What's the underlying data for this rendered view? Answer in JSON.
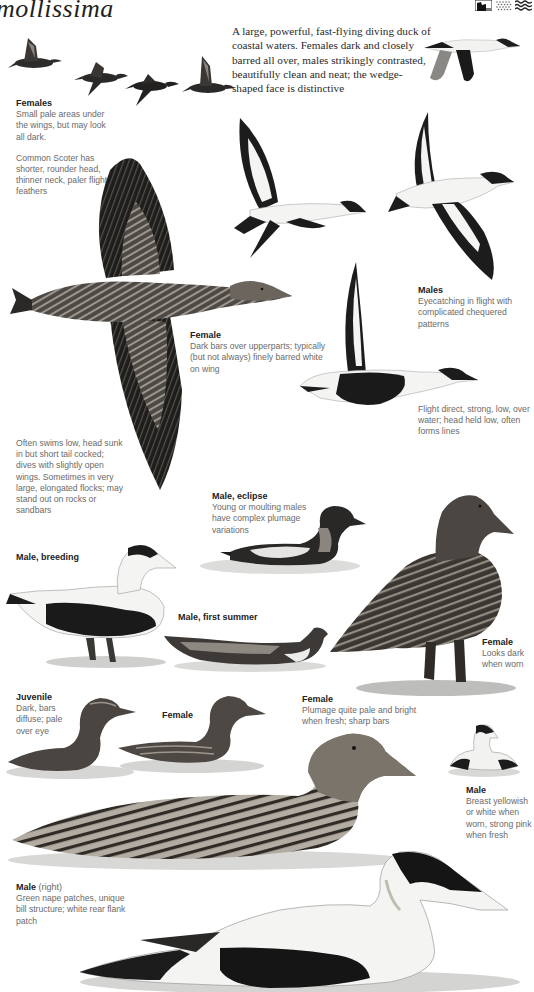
{
  "page": {
    "title_fragment": "mollissima",
    "habitat_icons": [
      {
        "name": "cliff-icon"
      },
      {
        "name": "shore-icon"
      },
      {
        "name": "sea-icon"
      }
    ],
    "intro": "A large, powerful, fast-flying diving duck of coastal waters. Females dark and closely barred all over, males strikingly contrasted, beautifully clean and neat; the wedge-shaped face is distinctive"
  },
  "captions": {
    "females_flock": {
      "heading": "Females",
      "text": "Small pale areas under the wings, but may look all dark.",
      "note": "Common Scoter has shorter, rounder head, thinner neck, paler flight feathers"
    },
    "female_flight": {
      "heading": "Female",
      "text": "Dark bars over upperparts; typically (but not always) finely barred white on wing"
    },
    "males_flight": {
      "heading": "Males",
      "text": "Eyecatching in flight with complicated chequered patterns"
    },
    "flight_behaviour": {
      "text": "Flight direct, strong, low, over water; head held low, often forms lines"
    },
    "swimming_behaviour": {
      "text": "Often swims low, head sunk in but short tail cocked; dives with slightly open wings. Sometimes in very large, elongated flocks; may stand out on rocks or sandbars"
    },
    "male_eclipse": {
      "heading": "Male, eclipse",
      "text": "Young or moulting males have complex plumage variations"
    },
    "male_breeding": {
      "heading": "Male, breeding"
    },
    "male_first_summer": {
      "heading": "Male, first summer"
    },
    "female_standing": {
      "heading": "Female",
      "text": "Looks dark when worn"
    },
    "juvenile": {
      "heading": "Juvenile",
      "text": "Dark, bars diffuse; pale over eye"
    },
    "female_swimming_small": {
      "heading": "Female"
    },
    "female_swimming_large": {
      "heading": "Female",
      "text": "Plumage quite pale and bright when fresh; sharp bars"
    },
    "male_small": {
      "heading": "Male",
      "text": "Breast yellowish or white when worn, strong pink when fresh"
    },
    "male_large": {
      "heading": "Male",
      "heading_note": "(right)",
      "text": "Green nape patches, unique bill structure; white rear flank patch"
    }
  },
  "colors": {
    "ink": "#1c1c1c",
    "female_brown": "#5a5550",
    "bar_light": "#a8a29a",
    "white_plumage": "#f4f4f2",
    "water": "#d6d6d4",
    "caption_text": "#6a6a6a"
  }
}
